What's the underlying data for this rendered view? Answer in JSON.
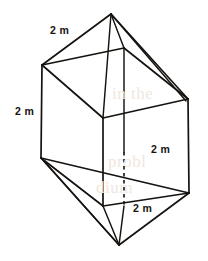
{
  "figure": {
    "name": "triangular-bipyramid-prism",
    "stroke_color": "#15120f",
    "background_color": "#ffffff",
    "labels": [
      {
        "id": "top-left-edge",
        "text": "2 m",
        "x": 50,
        "y": 25
      },
      {
        "id": "left-vertical-edge",
        "text": "2 m",
        "x": 15,
        "y": 106
      },
      {
        "id": "right-diagonal-edge",
        "text": "2 m",
        "x": 151,
        "y": 144
      },
      {
        "id": "bottom-front-edge",
        "text": "2 m",
        "x": 133,
        "y": 203
      }
    ],
    "vertices": {
      "top_apex": [
        111,
        14
      ],
      "upper_left": [
        42,
        65
      ],
      "upper_back": [
        124,
        48
      ],
      "upper_right": [
        188,
        99
      ],
      "upper_front": [
        103,
        118
      ],
      "lower_left": [
        41,
        158
      ],
      "lower_back": [
        124,
        152
      ],
      "lower_right": [
        189,
        193
      ],
      "lower_front": [
        103,
        206
      ],
      "bottom_apex": [
        119,
        245
      ]
    },
    "hidden_edges": [
      {
        "id": "back-vertical-dashed",
        "from": [
          124,
          152
        ],
        "to": [
          124,
          206
        ]
      }
    ],
    "bleed_text": [
      {
        "text": "in the",
        "x": 112,
        "y": 92
      },
      {
        "text": "probl",
        "x": 108,
        "y": 160
      },
      {
        "text": "dium",
        "x": 96,
        "y": 186
      }
    ]
  }
}
